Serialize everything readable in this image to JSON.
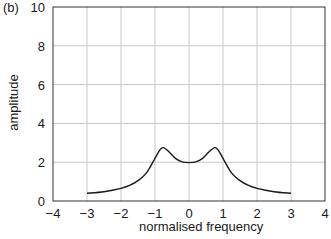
{
  "chart_data": {
    "type": "line",
    "panel_label": "(b)",
    "title": "",
    "xlabel": "normalised frequency",
    "ylabel": "amplitude",
    "xlim": [
      -4,
      4
    ],
    "ylim": [
      0,
      10
    ],
    "xticks": [
      -4,
      -3,
      -2,
      -1,
      0,
      1,
      2,
      3,
      4
    ],
    "yticks": [
      0,
      2,
      4,
      6,
      8,
      10
    ],
    "xtick_labels": [
      "−4",
      "−3",
      "−2",
      "−1",
      "0",
      "1",
      "2",
      "3",
      "4"
    ],
    "ytick_labels": [
      "0",
      "2",
      "4",
      "6",
      "8",
      "10"
    ],
    "grid": true,
    "legend": null,
    "series": [
      {
        "name": "amplitude",
        "color": "#1a1a1a",
        "x": [
          -3.0,
          -2.5,
          -2.0,
          -1.75,
          -1.5,
          -1.25,
          -1.0,
          -0.85,
          -0.75,
          -0.6,
          -0.4,
          -0.2,
          0.0,
          0.2,
          0.4,
          0.6,
          0.75,
          0.85,
          1.0,
          1.25,
          1.5,
          1.75,
          2.0,
          2.5,
          3.0
        ],
        "y": [
          0.4,
          0.48,
          0.65,
          0.8,
          1.05,
          1.45,
          2.2,
          2.65,
          2.75,
          2.55,
          2.2,
          2.02,
          1.98,
          2.02,
          2.2,
          2.55,
          2.75,
          2.65,
          2.2,
          1.45,
          1.05,
          0.8,
          0.65,
          0.48,
          0.4
        ]
      }
    ]
  },
  "colors": {
    "axis": "#333333",
    "grid": "#c8c8c8",
    "line": "#1a1a1a"
  }
}
